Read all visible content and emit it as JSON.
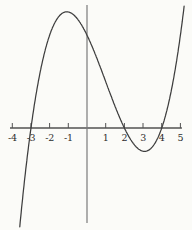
{
  "figure": {
    "background_color": "#fbfbf8",
    "x_axis_color": "#525252",
    "y_axis_color": "#7b7b7b",
    "curve_color": "#3e3e3e",
    "tick_label_color": "#2d2d2d"
  },
  "chart_data": {
    "type": "line",
    "title": "",
    "xlabel": "",
    "ylabel": "",
    "grid": false,
    "legend": "none",
    "x_tick_labels": [
      "-4",
      "-3",
      "-2",
      "-1",
      "1",
      "2",
      "3",
      "4",
      "5"
    ],
    "x_tick_values": [
      -4,
      -3,
      -2,
      -1,
      1,
      2,
      3,
      4,
      5
    ],
    "x_axis_range": [
      -4.12,
      5.08
    ],
    "curve_x_domain": [
      -3.6,
      5.2
    ],
    "function": "y = (x + 3)(x - 2)(x - 4)",
    "roots": [
      -3,
      2,
      4
    ],
    "y_intercept": 24,
    "local_max": {
      "x": -1.08,
      "y": 30.05
    },
    "local_min": {
      "x": 3.08,
      "y": -6.05
    },
    "series": [
      {
        "name": "cubic-curve",
        "color": "#3e3e3e",
        "points": [
          [
            -3.5,
            -20.63
          ],
          [
            -3,
            0
          ],
          [
            -2.5,
            14.63
          ],
          [
            -2,
            24
          ],
          [
            -1.5,
            28.88
          ],
          [
            -1,
            30
          ],
          [
            -0.5,
            28.13
          ],
          [
            0,
            24
          ],
          [
            0.5,
            18.38
          ],
          [
            1,
            12
          ],
          [
            1.5,
            5.63
          ],
          [
            2,
            0
          ],
          [
            2.5,
            -4.13
          ],
          [
            3,
            -6
          ],
          [
            3.5,
            -4.88
          ],
          [
            4,
            0
          ],
          [
            4.5,
            9.38
          ],
          [
            5,
            24
          ]
        ]
      }
    ]
  }
}
